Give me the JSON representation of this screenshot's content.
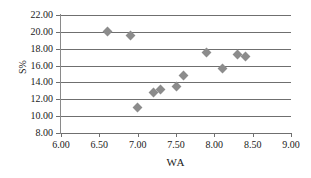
{
  "chart_data": {
    "type": "scatter",
    "title": "",
    "xlabel": "WA",
    "ylabel": "S%",
    "xlim": [
      6.0,
      9.0
    ],
    "ylim": [
      8.0,
      22.0
    ],
    "xticks": [
      "6.00",
      "6.50",
      "7.00",
      "7.50",
      "8.00",
      "8.50",
      "9.00"
    ],
    "yticks": [
      "8.00",
      "10.00",
      "12.00",
      "14.00",
      "16.00",
      "18.00",
      "20.00",
      "22.00"
    ],
    "xtick_values": [
      6.0,
      6.5,
      7.0,
      7.5,
      8.0,
      8.5,
      9.0
    ],
    "ytick_values": [
      8.0,
      10.0,
      12.0,
      14.0,
      16.0,
      18.0,
      20.0,
      22.0
    ],
    "grid": "horizontal",
    "legend": "none",
    "marker_color": "#8c8c8c",
    "marker_shape": "diamond",
    "series": [
      {
        "name": "S% vs WA",
        "points": [
          {
            "x": 6.6,
            "y": 20.0
          },
          {
            "x": 6.9,
            "y": 19.6
          },
          {
            "x": 7.0,
            "y": 11.0
          },
          {
            "x": 7.2,
            "y": 12.8
          },
          {
            "x": 7.3,
            "y": 13.2
          },
          {
            "x": 7.5,
            "y": 13.5
          },
          {
            "x": 7.6,
            "y": 14.8
          },
          {
            "x": 7.9,
            "y": 17.5
          },
          {
            "x": 8.1,
            "y": 15.6
          },
          {
            "x": 8.3,
            "y": 17.3
          },
          {
            "x": 8.4,
            "y": 17.1
          }
        ]
      }
    ]
  }
}
